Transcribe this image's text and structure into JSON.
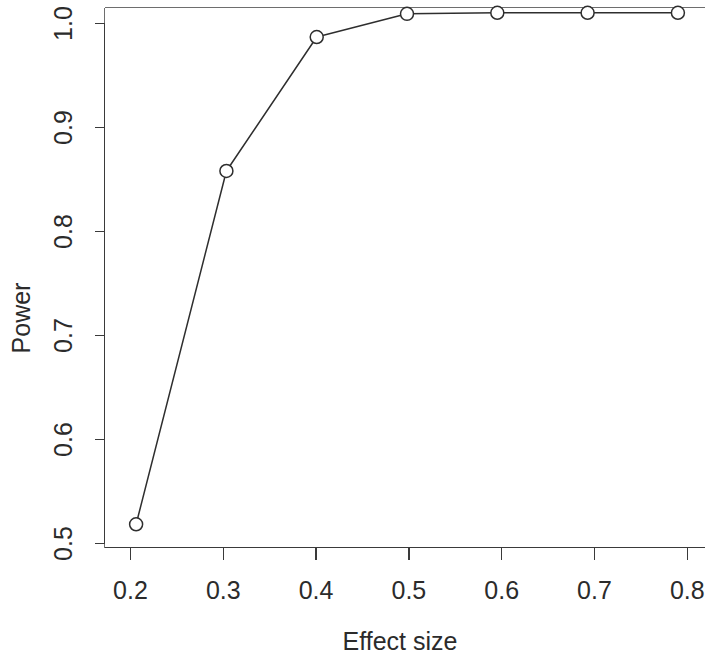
{
  "chart_data": {
    "type": "line",
    "title": "",
    "subtitle": "",
    "xlabel": "Effect size",
    "ylabel": "Power",
    "x": [
      0.2,
      0.3,
      0.4,
      0.5,
      0.6,
      0.7,
      0.8
    ],
    "values": [
      0.515,
      0.85,
      0.977,
      0.999,
      1.0,
      1.0,
      1.0
    ],
    "series": [
      {
        "name": "Power curve",
        "x": [
          0.2,
          0.3,
          0.4,
          0.5,
          0.6,
          0.7,
          0.8
        ],
        "values": [
          0.515,
          0.85,
          0.977,
          0.999,
          1.0,
          1.0,
          1.0
        ]
      }
    ],
    "xlim": [
      0.165,
      0.83
    ],
    "ylim": [
      0.493,
      1.005
    ],
    "xticks": [
      0.2,
      0.3,
      0.4,
      0.5,
      0.6,
      0.7,
      0.8
    ],
    "xtick_labels": [
      "0.2",
      "0.3",
      "0.4",
      "0.5",
      "0.6",
      "0.7",
      "0.8"
    ],
    "yticks": [
      0.5,
      0.6,
      0.7,
      0.8,
      0.9,
      1.0
    ],
    "ytick_labels": [
      "0.5",
      "0.6",
      "0.7",
      "0.8",
      "0.9",
      "1.0"
    ],
    "grid": false,
    "legend": null,
    "marker": "open-circle",
    "line_color": "#2e2e2e",
    "marker_fill": "#ffffff",
    "axis_color": "#3a3a3a",
    "background": "#ffffff",
    "annotations": []
  }
}
